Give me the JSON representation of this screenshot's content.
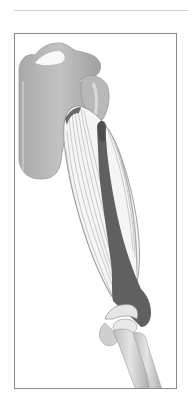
{
  "figure": {
    "alt": "Anatomical illustration of the upper arm showing shoulder blade, humerus, upper-arm muscle fibers with dark tendon, and elbow joint with forearm bones",
    "colors": {
      "background": "#ffffff",
      "rule": "#cfcfcf",
      "frame_border": "#8a8a8a",
      "bone_fill": "#b4b4b4",
      "bone_shadow": "#9a9a9a",
      "bone_highlight": "#d9d9d9",
      "muscle_fill": "#f4f4f4",
      "muscle_lines": "#8c8c8c",
      "tendon_dark": "#5e5e5e"
    },
    "labels": []
  }
}
